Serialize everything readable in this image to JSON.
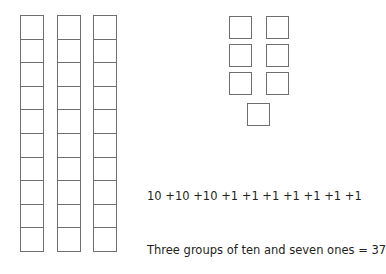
{
  "diagram": {
    "tens": {
      "count": 3,
      "cells_per_rod": 10,
      "rods_x": [
        20,
        57,
        93
      ]
    },
    "ones": {
      "count": 7,
      "positions": [
        {
          "x": 229,
          "y": 16
        },
        {
          "x": 266,
          "y": 16
        },
        {
          "x": 229,
          "y": 44
        },
        {
          "x": 266,
          "y": 44
        },
        {
          "x": 229,
          "y": 72
        },
        {
          "x": 266,
          "y": 72
        },
        {
          "x": 247,
          "y": 103
        }
      ]
    },
    "equation": "10 +10 +10 +1 +1 +1 +1 +1 +1 +1",
    "sentence": "Three groups of ten and seven ones = 37",
    "colors": {
      "stroke": "#6d6e71",
      "text": "#231f20"
    }
  }
}
